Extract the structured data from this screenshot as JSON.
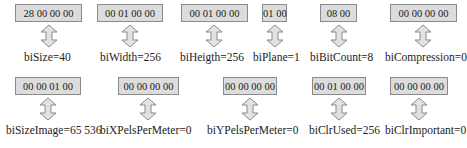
{
  "diagram": {
    "title": "",
    "rows": [
      {
        "fields": [
          {
            "bytes": "28 00 00 00",
            "label": "biSize=40"
          },
          {
            "bytes": "00 01 00 00",
            "label": "biWidth=256"
          },
          {
            "bytes": "00 01 00 00",
            "label": "biHeigth=256"
          },
          {
            "bytes": "01 00",
            "label": "biPlane=1"
          },
          {
            "bytes": "08 00",
            "label": "biBitCount=8"
          },
          {
            "bytes": "00 00 00 00",
            "label": "biCompression=0"
          }
        ]
      },
      {
        "fields": [
          {
            "bytes": "00 00 01 00",
            "label": "biSizeImage=65 536"
          },
          {
            "bytes": "00 00 00 00",
            "label": "biXPelsPerMeter=0"
          },
          {
            "bytes": "00 00 00 00",
            "label": "biYPelsPerMeter=0"
          },
          {
            "bytes": "00 01 00 00",
            "label": "biClrUsed=256"
          },
          {
            "bytes": "00 00 00 00",
            "label": "biClrImportant=0"
          }
        ]
      }
    ],
    "colors": {
      "box_fill": "#dcdcdc",
      "box_border": "#8a8a8a",
      "arrow_fill": "#e2e2e2",
      "arrow_stroke": "#8a8a8a"
    }
  }
}
